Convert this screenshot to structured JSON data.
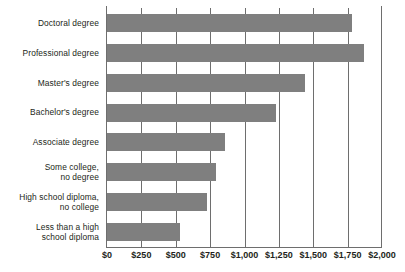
{
  "chart_data": {
    "type": "bar",
    "orientation": "horizontal",
    "title": "",
    "subtitle": "",
    "xlabel": "",
    "ylabel": "",
    "xlim": [
      0,
      2000
    ],
    "grid": true,
    "legend": false,
    "legend_position": "none",
    "bar_color": "#7f7f7f",
    "axis_color": "#6e6e6e",
    "background_color": "#ffffff",
    "categories": [
      "Doctoral degree",
      "Professional degree",
      "Master's degree",
      "Bachelor's degree",
      "Associate degree",
      "Some college,\nno degree",
      "High school diploma,\nno college",
      "Less than a high\nschool diploma"
    ],
    "values": [
      1780,
      1870,
      1440,
      1230,
      860,
      790,
      730,
      530
    ],
    "tick_values": [
      0,
      250,
      500,
      750,
      1000,
      1250,
      1500,
      1750,
      2000
    ],
    "tick_labels": [
      "$0",
      "$250",
      "$500",
      "$750",
      "$1,000",
      "$1,250",
      "$1,500",
      "$1,750",
      "$2,000"
    ]
  }
}
